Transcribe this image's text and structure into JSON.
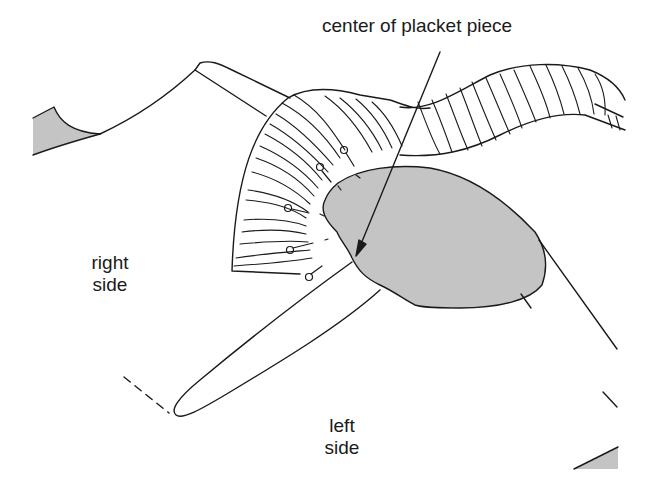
{
  "diagram": {
    "type": "sewing-instruction-illustration",
    "callout": {
      "label": "center of placket piece"
    },
    "labels": {
      "right_side_line1": "right",
      "right_side_line2": "side",
      "left_side_line1": "left",
      "left_side_line2": "side"
    },
    "elements": [
      "garment-neckline",
      "pleated-fan-section",
      "wavy-striped-band",
      "shaded-placket-piece",
      "straight-pins",
      "slash-opening",
      "dashed-fold-line",
      "shaded-corner-swatches"
    ],
    "pin_count": 7,
    "colors": {
      "stroke": "#1a1a1a",
      "fill_shaded": "#c4c4c4",
      "background": "#ffffff"
    }
  }
}
